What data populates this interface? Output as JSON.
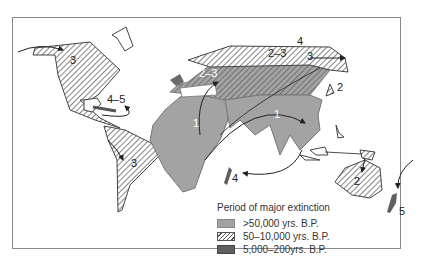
{
  "map": {
    "legend": {
      "title": "Period of major extinction",
      "items": [
        {
          "label": ">50,000 yrs. B.P.",
          "style": "solid-light-gray",
          "color": "#a3a3a3"
        },
        {
          "label": "50–10,000 yrs. B.P.",
          "style": "diagonal-hatch",
          "color": "#555555"
        },
        {
          "label": "5,000–200yrs. B.P.",
          "style": "solid-dark-gray",
          "color": "#5f5f5f"
        }
      ]
    },
    "region_labels": {
      "north_america": "3",
      "caribbean": "4–5",
      "south_america": "3",
      "africa": "1",
      "south_asia": "1",
      "europe": "2–3",
      "north_asia": "2–3",
      "arctic": "4",
      "bering": "3",
      "japan": "2",
      "madagascar": "4",
      "australia": "2",
      "new_zealand": "5"
    }
  }
}
